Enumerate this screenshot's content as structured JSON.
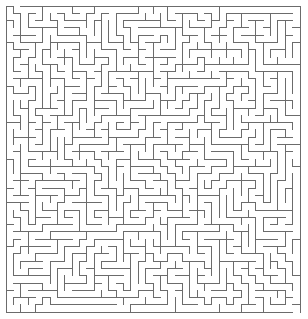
{
  "maze": {
    "cols": 40,
    "rows": 42,
    "origin_x": 6,
    "origin_y": 6,
    "cell_w": 7.35,
    "cell_h": 7.29,
    "wall_color": "#6b6b6b",
    "background": "#ffffff",
    "wall_width": 1,
    "entrance": {
      "side": "top",
      "col": 1
    },
    "exit": {
      "side": "bottom",
      "col": 39
    },
    "seed": 20240519
  }
}
